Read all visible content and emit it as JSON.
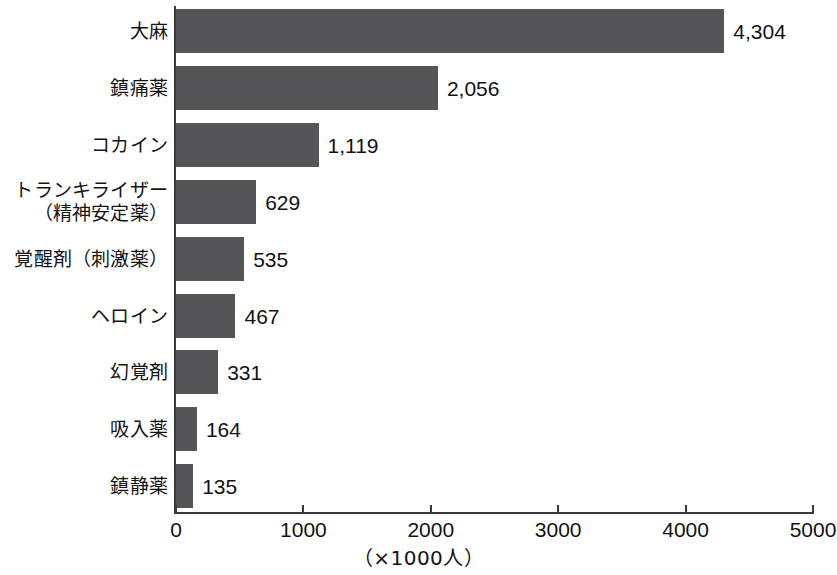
{
  "chart_data": {
    "type": "bar",
    "orientation": "horizontal",
    "title": "",
    "subtitle": "",
    "xlabel": "（×1000人）",
    "ylabel": "",
    "xlim": [
      0,
      5000
    ],
    "xticks": [
      0,
      1000,
      2000,
      3000,
      4000,
      5000
    ],
    "xtick_labels": [
      "0",
      "1000",
      "2000",
      "3000",
      "4000",
      "5000"
    ],
    "grid": false,
    "legend": null,
    "bar_color": "#555558",
    "axis_color": "#3a3a3a",
    "background": "#ffffff",
    "categories": [
      "大麻",
      "鎮痛薬",
      "コカイン",
      "トランキライザー（精神安定薬）",
      "覚醒剤（刺激薬）",
      "ヘロイン",
      "幻覚剤",
      "吸入薬",
      "鎮静薬"
    ],
    "values": [
      4304,
      2056,
      1119,
      629,
      535,
      467,
      331,
      164,
      135
    ],
    "value_labels": [
      "4,304",
      "2,056",
      "1,119",
      "629",
      "535",
      "467",
      "331",
      "164",
      "135"
    ],
    "bars": [
      {
        "label_lines": [
          "大麻"
        ],
        "value": 4304,
        "value_label": "4,304"
      },
      {
        "label_lines": [
          "鎮痛薬"
        ],
        "value": 2056,
        "value_label": "2,056"
      },
      {
        "label_lines": [
          "コカイン"
        ],
        "value": 1119,
        "value_label": "1,119"
      },
      {
        "label_lines": [
          "トランキライザー",
          "（精神安定薬）"
        ],
        "value": 629,
        "value_label": "629"
      },
      {
        "label_lines": [
          "覚醒剤（刺激薬）"
        ],
        "value": 535,
        "value_label": "535"
      },
      {
        "label_lines": [
          "ヘロイン"
        ],
        "value": 467,
        "value_label": "467"
      },
      {
        "label_lines": [
          "幻覚剤"
        ],
        "value": 331,
        "value_label": "331"
      },
      {
        "label_lines": [
          "吸入薬"
        ],
        "value": 164,
        "value_label": "164"
      },
      {
        "label_lines": [
          "鎮静薬"
        ],
        "value": 135,
        "value_label": "135"
      }
    ]
  }
}
